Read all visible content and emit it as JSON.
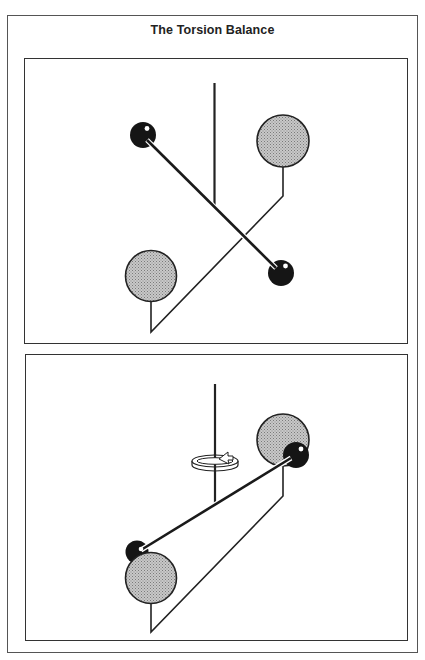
{
  "title": "The Torsion Balance",
  "colors": {
    "frame": "#555555",
    "panel_border": "#333333",
    "large_ball_fill": "#b8b8b8",
    "small_ball_fill": "#151515",
    "line": "#222222"
  },
  "panels": [
    {
      "name": "initial-position",
      "elements": [
        "fiber",
        "rod",
        "small-ball-left",
        "small-ball-right",
        "large-ball-left",
        "large-ball-right",
        "large-ball-frame"
      ]
    },
    {
      "name": "rotated-position",
      "elements": [
        "fiber",
        "rotation-arrow",
        "rod",
        "small-ball-left",
        "small-ball-right",
        "large-ball-left",
        "large-ball-right",
        "large-ball-frame"
      ]
    }
  ]
}
